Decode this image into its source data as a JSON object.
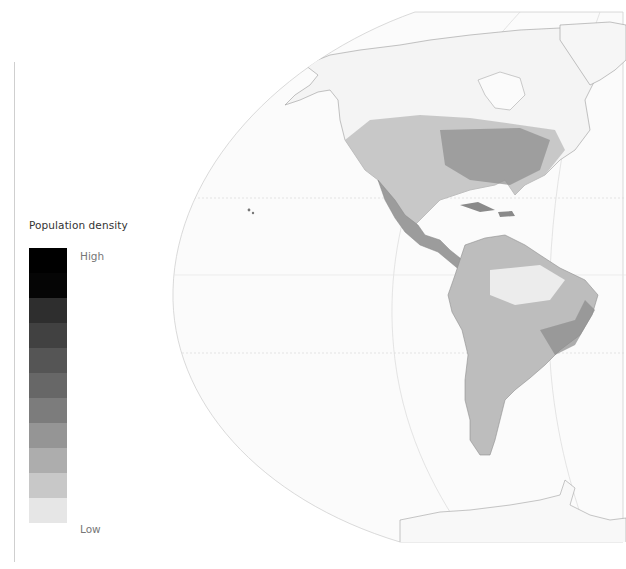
{
  "legend": {
    "title": "Population density",
    "high_label": "High",
    "low_label": "Low",
    "steps": [
      "#000000",
      "#050505",
      "#2e2e2e",
      "#414141",
      "#555555",
      "#676767",
      "#7c7c7c",
      "#959595",
      "#adadad",
      "#c8c8c8",
      "#e6e6e6"
    ]
  },
  "map": {
    "subject": "Americas population density",
    "projection_fill": "#fbfbfb",
    "graticule_color": "#d6d6d6",
    "coast_color": "#9a9a9a",
    "regions": [
      "North America",
      "Central America",
      "Caribbean",
      "South America",
      "Greenland",
      "Antarctica"
    ]
  }
}
